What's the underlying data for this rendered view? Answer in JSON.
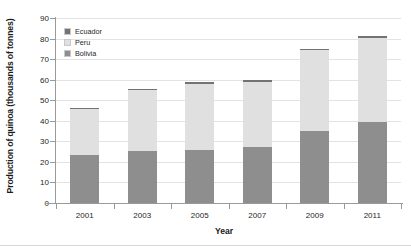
{
  "chart_data": {
    "type": "bar",
    "subtype": "stacked-vertical",
    "title": "",
    "xlabel": "Year",
    "ylabel": "Production of quinoa (thousands of tonnes)",
    "categories": [
      "2001",
      "2003",
      "2005",
      "2007",
      "2009",
      "2011"
    ],
    "series": [
      {
        "name": "Bolivia",
        "color": "#8e8e8e",
        "values": [
          23.3,
          25.3,
          25.6,
          27.2,
          35.0,
          39.2
        ]
      },
      {
        "name": "Peru",
        "color": "#e0e0e0",
        "values": [
          22.2,
          29.6,
          32.4,
          31.8,
          39.2,
          41.0
        ]
      },
      {
        "name": "Ecuador",
        "color": "#737373",
        "values": [
          0.5,
          0.6,
          0.7,
          0.7,
          0.8,
          1.0
        ]
      }
    ],
    "stack_order_bottom_to_top": [
      "Bolivia",
      "Peru",
      "Ecuador"
    ],
    "totals": [
      46.0,
      55.5,
      58.7,
      59.7,
      75.0,
      81.2
    ],
    "ylim": [
      0,
      90
    ],
    "yticks": [
      0,
      10,
      20,
      30,
      40,
      50,
      60,
      70,
      80,
      90
    ],
    "ytick_labels": [
      "0",
      "10",
      "20",
      "30",
      "40",
      "50",
      "60",
      "70",
      "80",
      "90"
    ],
    "grid": true,
    "grid_axis": "y",
    "legend_position": "top-left-inside",
    "legend_entries": [
      "Ecuador",
      "Peru",
      "Bolivia"
    ],
    "legend_colors": [
      "#737373",
      "#e0e0e0",
      "#8e8e8e"
    ]
  },
  "legend": {
    "items": [
      {
        "label": "Ecuador"
      },
      {
        "label": "Peru"
      },
      {
        "label": "Bolivia"
      }
    ]
  },
  "axes": {
    "y_title": "Production of quinoa (thousands of tonnes)",
    "x_title": "Year"
  },
  "colors": {
    "bolivia": "#8e8e8e",
    "peru": "#e0e0e0",
    "ecuador": "#737373",
    "grid": "#e3e3e3",
    "axis": "#9a9a9a",
    "text": "#262626"
  }
}
